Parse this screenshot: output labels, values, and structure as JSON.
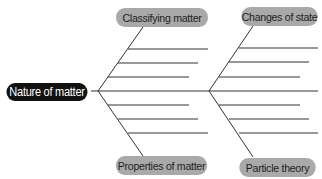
{
  "diagram": {
    "type": "fishbone",
    "head": {
      "label": "Nature of matter"
    },
    "categories": [
      {
        "label": "Classifying matter",
        "position": "top-left",
        "blank_lines": 3
      },
      {
        "label": "Changes of state",
        "position": "top-right",
        "blank_lines": 3
      },
      {
        "label": "Properties of matter",
        "position": "bottom-left",
        "blank_lines": 3
      },
      {
        "label": "Particle theory",
        "position": "bottom-right",
        "blank_lines": 3
      }
    ],
    "spine_blank_line": true,
    "colors": {
      "category_pill": "#a9a9a9",
      "head_pill": "#111111",
      "line": "#333333"
    }
  }
}
